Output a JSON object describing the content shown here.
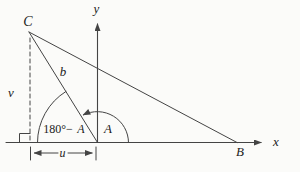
{
  "figure": {
    "labels": {
      "vertex_c": "C",
      "vertex_b": "B",
      "x_axis": "x",
      "y_axis": "y",
      "altitude_v": "v",
      "base_u": "u",
      "side_b": "b",
      "angle_a": "A",
      "angle_supplement_prefix": "180°−",
      "angle_supplement_a": "A"
    },
    "colors": {
      "line": "#444444",
      "text": "#222222",
      "background": "#fbfbf9"
    }
  }
}
